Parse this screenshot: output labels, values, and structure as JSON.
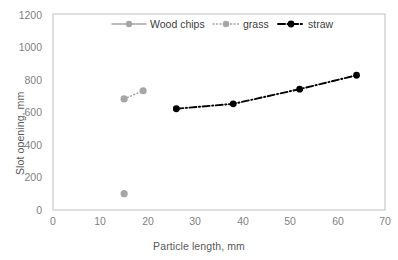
{
  "chart_data": {
    "type": "scatter",
    "title": "",
    "xlabel": "Particle length, mm",
    "ylabel": "Slot opening, mm",
    "xlim": [
      0,
      70
    ],
    "ylim": [
      0,
      1200
    ],
    "xticks": [
      0,
      10,
      20,
      30,
      40,
      50,
      60,
      70
    ],
    "yticks": [
      0,
      200,
      400,
      600,
      800,
      1000,
      1200
    ],
    "grid": false,
    "legend_position": "top-center",
    "series": [
      {
        "name": "Wood chips",
        "color": "#A6A6A6",
        "linestyle": "solid",
        "marker": "circle",
        "x": [
          15
        ],
        "y": [
          100
        ]
      },
      {
        "name": "grass",
        "color": "#A6A6A6",
        "linestyle": "dotted",
        "marker": "circle",
        "x": [
          15,
          19
        ],
        "y": [
          680,
          730
        ]
      },
      {
        "name": "straw",
        "color": "#000000",
        "linestyle": "dashdot",
        "marker": "circle",
        "x": [
          26,
          38,
          52,
          64
        ],
        "y": [
          620,
          650,
          740,
          825
        ]
      }
    ]
  },
  "legend": {
    "items": [
      {
        "label": "Wood chips"
      },
      {
        "label": "grass"
      },
      {
        "label": "straw"
      }
    ]
  },
  "axes": {
    "x_title": "Particle length, mm",
    "y_title": "Slot opening, mm",
    "x_tick_labels": [
      "0",
      "10",
      "20",
      "30",
      "40",
      "50",
      "60",
      "70"
    ],
    "y_tick_labels": [
      "0",
      "200",
      "400",
      "600",
      "800",
      "1000",
      "1200"
    ]
  },
  "colors": {
    "gray_series": "#A6A6A6",
    "black_series": "#000000",
    "axis_line": "#BFBFBF",
    "tick_text": "#7f7f7f",
    "title_text": "#595959"
  }
}
